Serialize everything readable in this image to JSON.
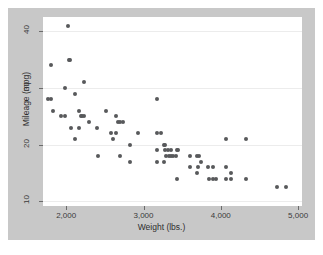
{
  "figure": {
    "background_color": "#c8c8c8",
    "plot_background_color": "#ffffff",
    "page_background_color": "#ffffff"
  },
  "chart_data": {
    "type": "scatter",
    "title": "",
    "xlabel": "Weight (lbs.)",
    "ylabel": "Mileage (mpg)",
    "xlim": [
      1700,
      5050
    ],
    "ylim": [
      9.2,
      42.5
    ],
    "xticks": [
      2000,
      3000,
      4000,
      5000
    ],
    "xtick_labels": [
      "2,000",
      "3,000",
      "4,000",
      "5,000"
    ],
    "yticks": [
      10,
      20,
      30,
      40
    ],
    "ytick_labels": [
      "10",
      "20",
      "30",
      "40"
    ],
    "grid": "horizontal",
    "legend": "none",
    "marker_color": "#58595b",
    "marker_size": 4,
    "n_points": 74,
    "points": [
      {
        "x": 2020,
        "y": 41
      },
      {
        "x": 2050,
        "y": 35
      },
      {
        "x": 2040,
        "y": 35
      },
      {
        "x": 1800,
        "y": 34
      },
      {
        "x": 2230,
        "y": 31
      },
      {
        "x": 1980,
        "y": 30
      },
      {
        "x": 2110,
        "y": 29
      },
      {
        "x": 1760,
        "y": 28
      },
      {
        "x": 1800,
        "y": 28
      },
      {
        "x": 3170,
        "y": 28
      },
      {
        "x": 1830,
        "y": 26
      },
      {
        "x": 2160,
        "y": 26
      },
      {
        "x": 2520,
        "y": 26
      },
      {
        "x": 1930,
        "y": 25
      },
      {
        "x": 1980,
        "y": 25
      },
      {
        "x": 2190,
        "y": 25
      },
      {
        "x": 2200,
        "y": 25
      },
      {
        "x": 2230,
        "y": 25
      },
      {
        "x": 2650,
        "y": 25
      },
      {
        "x": 2290,
        "y": 24
      },
      {
        "x": 2670,
        "y": 24
      },
      {
        "x": 2700,
        "y": 24
      },
      {
        "x": 2730,
        "y": 24
      },
      {
        "x": 2060,
        "y": 23
      },
      {
        "x": 2160,
        "y": 23
      },
      {
        "x": 2400,
        "y": 23
      },
      {
        "x": 2580,
        "y": 22
      },
      {
        "x": 2640,
        "y": 22
      },
      {
        "x": 2930,
        "y": 22
      },
      {
        "x": 3180,
        "y": 22
      },
      {
        "x": 3220,
        "y": 22
      },
      {
        "x": 2110,
        "y": 21
      },
      {
        "x": 2600,
        "y": 21
      },
      {
        "x": 4060,
        "y": 21
      },
      {
        "x": 4330,
        "y": 21
      },
      {
        "x": 2830,
        "y": 20
      },
      {
        "x": 3260,
        "y": 20
      },
      {
        "x": 3280,
        "y": 20
      },
      {
        "x": 3180,
        "y": 19
      },
      {
        "x": 3310,
        "y": 19
      },
      {
        "x": 3350,
        "y": 19
      },
      {
        "x": 3430,
        "y": 19
      },
      {
        "x": 3450,
        "y": 19
      },
      {
        "x": 2410,
        "y": 18
      },
      {
        "x": 2690,
        "y": 18
      },
      {
        "x": 3330,
        "y": 18
      },
      {
        "x": 3360,
        "y": 18
      },
      {
        "x": 3420,
        "y": 18
      },
      {
        "x": 3600,
        "y": 18
      },
      {
        "x": 3690,
        "y": 18
      },
      {
        "x": 3720,
        "y": 18
      },
      {
        "x": 2830,
        "y": 17
      },
      {
        "x": 3170,
        "y": 17
      },
      {
        "x": 3260,
        "y": 17
      },
      {
        "x": 3740,
        "y": 17
      },
      {
        "x": 3600,
        "y": 16
      },
      {
        "x": 3700,
        "y": 16
      },
      {
        "x": 3830,
        "y": 16
      },
      {
        "x": 3900,
        "y": 16
      },
      {
        "x": 4060,
        "y": 16
      },
      {
        "x": 3690,
        "y": 15
      },
      {
        "x": 4130,
        "y": 15
      },
      {
        "x": 3430,
        "y": 14
      },
      {
        "x": 3850,
        "y": 14
      },
      {
        "x": 3900,
        "y": 14
      },
      {
        "x": 3940,
        "y": 14
      },
      {
        "x": 4070,
        "y": 14
      },
      {
        "x": 4130,
        "y": 14
      },
      {
        "x": 4330,
        "y": 14
      },
      {
        "x": 4720,
        "y": 12.5
      },
      {
        "x": 4840,
        "y": 12.5
      },
      {
        "x": 3280,
        "y": 19
      },
      {
        "x": 3290,
        "y": 18
      },
      {
        "x": 3380,
        "y": 18
      }
    ]
  }
}
